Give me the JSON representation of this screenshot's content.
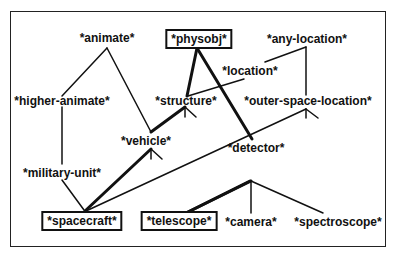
{
  "diagram": {
    "type": "concept-hierarchy",
    "nodes": [
      {
        "id": "animate",
        "label": "*animate*",
        "boxed": false,
        "x": 107,
        "y": 38
      },
      {
        "id": "physobj",
        "label": "*physobj*",
        "boxed": true,
        "x": 199,
        "y": 39
      },
      {
        "id": "any-location",
        "label": "*any-location*",
        "boxed": false,
        "x": 307,
        "y": 39
      },
      {
        "id": "location",
        "label": "*location*",
        "boxed": false,
        "x": 250,
        "y": 71
      },
      {
        "id": "higher-animate",
        "label": "*higher-animate*",
        "boxed": false,
        "x": 62,
        "y": 101
      },
      {
        "id": "structure",
        "label": "*structure*",
        "boxed": false,
        "x": 186,
        "y": 101
      },
      {
        "id": "outer-space-location",
        "label": "*outer-space-location*",
        "boxed": false,
        "x": 308,
        "y": 101
      },
      {
        "id": "vehicle",
        "label": "*vehicle*",
        "boxed": false,
        "x": 146,
        "y": 141
      },
      {
        "id": "military-unit",
        "label": "*military-unit*",
        "boxed": false,
        "x": 62,
        "y": 173
      },
      {
        "id": "detector",
        "label": "*detector*",
        "boxed": false,
        "x": 256,
        "y": 148
      },
      {
        "id": "spacecraft",
        "label": "*spacecraft*",
        "boxed": true,
        "x": 82,
        "y": 221
      },
      {
        "id": "telescope",
        "label": "*telescope*",
        "boxed": true,
        "x": 179,
        "y": 221
      },
      {
        "id": "camera",
        "label": "*camera*",
        "boxed": false,
        "x": 251,
        "y": 222
      },
      {
        "id": "spectroscope",
        "label": "*spectroscope*",
        "boxed": false,
        "x": 338,
        "y": 222
      }
    ],
    "edges": [
      {
        "from": "higher-animate",
        "to": "animate",
        "bold": false
      },
      {
        "from": "vehicle",
        "to": "animate",
        "bold": false
      },
      {
        "from": "structure",
        "to": "physobj",
        "bold": true
      },
      {
        "from": "detector",
        "to": "physobj",
        "bold": true
      },
      {
        "from": "location",
        "to": "any-location",
        "bold": false
      },
      {
        "from": "outer-space-location",
        "to": "any-location",
        "bold": false
      },
      {
        "from": "structure",
        "to": "location",
        "bold": false
      },
      {
        "from": "vehicle",
        "to": "structure",
        "bold": true
      },
      {
        "from": "military-unit",
        "to": "higher-animate",
        "bold": false
      },
      {
        "from": "spacecraft",
        "to": "military-unit",
        "bold": false
      },
      {
        "from": "spacecraft",
        "to": "vehicle",
        "bold": true
      },
      {
        "from": "spacecraft",
        "to": "outer-space-location",
        "bold": false
      },
      {
        "from": "telescope",
        "to": "detector",
        "bold": true
      },
      {
        "from": "camera",
        "to": "detector",
        "bold": false
      },
      {
        "from": "spectroscope",
        "to": "detector",
        "bold": false
      }
    ]
  }
}
